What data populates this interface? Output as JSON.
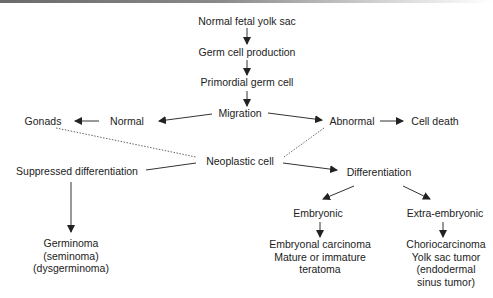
{
  "diagram": {
    "nodes": {
      "yolk_sac": "Normal fetal yolk sac",
      "germ_cell_production": "Germ cell production",
      "primordial_germ_cell": "Primordial germ cell",
      "migration": "Migration",
      "normal": "Normal",
      "gonads": "Gonads",
      "abnormal": "Abnormal",
      "cell_death": "Cell death",
      "neoplastic_cell": "Neoplastic cell",
      "suppressed_differentiation": "Suppressed differentiation",
      "differentiation": "Differentiation",
      "embryonic": "Embryonic",
      "extra_embryonic": "Extra-embryonic",
      "germinoma": [
        "Germinoma",
        "(seminoma)",
        "(dysgerminoma)"
      ],
      "embryonal": [
        "Embryonal carcinoma",
        "Mature or immature",
        "teratoma"
      ],
      "choriocarcinoma": [
        "Choriocarcinoma",
        "Yolk sac tumor",
        "(endodermal",
        "sinus tumor)"
      ]
    },
    "edges": [
      {
        "from": "yolk_sac",
        "to": "germ_cell_production",
        "style": "arrow"
      },
      {
        "from": "germ_cell_production",
        "to": "primordial_germ_cell",
        "style": "arrow"
      },
      {
        "from": "primordial_germ_cell",
        "to": "migration",
        "style": "arrow"
      },
      {
        "from": "migration",
        "to": "normal",
        "style": "arrow"
      },
      {
        "from": "normal",
        "to": "gonads",
        "style": "arrow"
      },
      {
        "from": "migration",
        "to": "abnormal",
        "style": "arrow"
      },
      {
        "from": "abnormal",
        "to": "cell_death",
        "style": "arrow"
      },
      {
        "from": "gonads",
        "to": "neoplastic_cell",
        "style": "dotted"
      },
      {
        "from": "abnormal",
        "to": "neoplastic_cell",
        "style": "dotted"
      },
      {
        "from": "neoplastic_cell",
        "to": "suppressed_differentiation",
        "style": "line"
      },
      {
        "from": "neoplastic_cell",
        "to": "differentiation",
        "style": "arrow"
      },
      {
        "from": "suppressed_differentiation",
        "to": "germinoma",
        "style": "arrow"
      },
      {
        "from": "differentiation",
        "to": "embryonic",
        "style": "arrow"
      },
      {
        "from": "differentiation",
        "to": "extra_embryonic",
        "style": "arrow"
      },
      {
        "from": "embryonic",
        "to": "embryonal",
        "style": "arrow"
      },
      {
        "from": "extra_embryonic",
        "to": "choriocarcinoma",
        "style": "arrow"
      }
    ],
    "colors": {
      "text": "#222222",
      "line": "#333333",
      "dotted": "#666666"
    }
  }
}
